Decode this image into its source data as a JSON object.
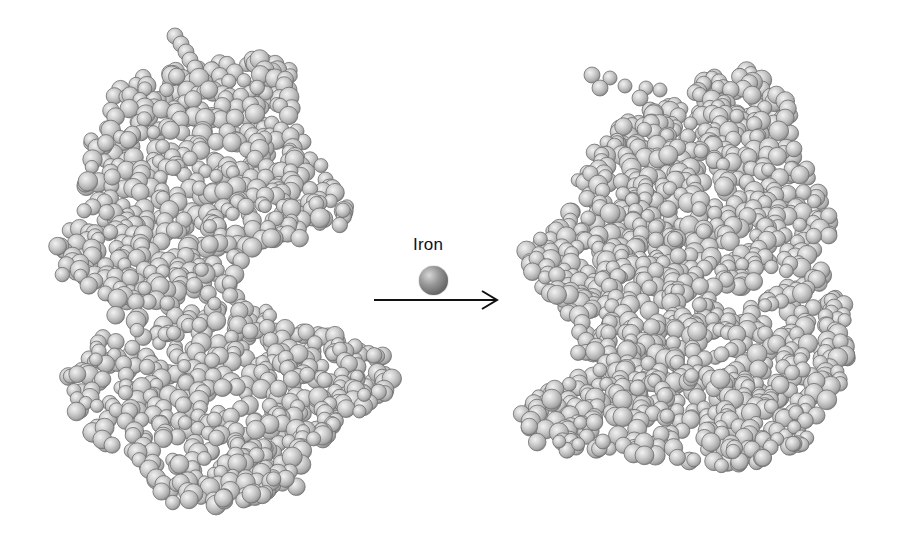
{
  "diagram": {
    "before_structure": {
      "name": "apo-protein (open conformation)",
      "color": "#c4c4c4",
      "outline_color": "#6e6e6e"
    },
    "reagent": {
      "label": "Iron",
      "sphere_color": "#7a7a7a"
    },
    "arrow": {
      "direction": "right",
      "color": "#111111"
    },
    "after_structure": {
      "name": "holo-protein (closed conformation)",
      "color": "#c4c4c4",
      "outline_color": "#6e6e6e"
    }
  }
}
